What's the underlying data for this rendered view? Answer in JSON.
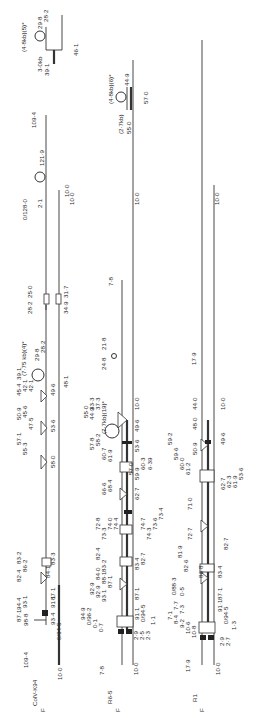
{
  "figure": {
    "type": "plasmid restriction/physical maps (rotated 90°)",
    "maps": [
      {
        "name": "ColV-K94",
        "orientation_label": "F",
        "ends": {
          "left_top": "109·4",
          "left_bottom": "10·0"
        },
        "labels_top": [
          "98·8",
          "94·4",
          "87·1",
          "93·1",
          "86·2",
          "83·2",
          "82·4",
          "57·1",
          "50·9",
          "55·3",
          "47·5",
          "45·6",
          "45·4",
          "42·1",
          "39·1",
          "29·8",
          "28·2",
          "28·2",
          "25·0",
          "0/128·0",
          "2·1",
          "121·9",
          "109·4"
        ],
        "labels_bottom": [
          "0/94·5",
          "93·4",
          "91·1",
          "87·1",
          "84·1",
          "83·3",
          "58·0",
          "53·6",
          "49·6",
          "48·1",
          "34·9",
          "31·7",
          "10·0"
        ],
        "insert_label": "(7·75 kb)(4)*"
      },
      {
        "name": "R6-5",
        "orientation_label": "F",
        "ends": {
          "left_top": "7·8",
          "left_bottom": "10·0"
        },
        "labels_top": [
          "94·9",
          "0/96·2",
          "0·1",
          "0·7",
          "92·9",
          "92·9",
          "93·1",
          "88·1",
          "84·0",
          "87·1",
          "82·4",
          "83·2",
          "72·8",
          "73·3",
          "74·0",
          "74·4",
          "66·6",
          "68·4",
          "58·2",
          "57·8",
          "60·7",
          "61·9",
          "55·0",
          "44·9",
          "33·3",
          "37·3",
          "24·8",
          "21·8",
          "7·8"
        ],
        "labels_bottom": [
          "1·1",
          "2·3",
          "2·5",
          "2·9",
          "91·1",
          "0/94·5",
          "87·1",
          "83·4",
          "82·7",
          "74·7",
          "74·3",
          "73·6",
          "73·4",
          "71·2",
          "62·7",
          "60·3",
          "59·9",
          "6·39",
          "57·0",
          "53·6",
          "49·6",
          "10·0"
        ],
        "insert_label": "(7·7kb)(19)*"
      },
      {
        "name": "R1",
        "orientation_label": "F",
        "ends": {
          "left_top": "17·9",
          "left_bottom": "10·0"
        },
        "labels_top": [
          "10·8",
          "10·6",
          "9·2",
          "8·4",
          "7·1",
          "7·7",
          "7·3",
          "0·5",
          "0/88·3",
          "82·6",
          "81·9",
          "72·7",
          "71·0",
          "61·2",
          "60·0",
          "59·6",
          "59·2",
          "50·9",
          "48·0",
          "44·0",
          "17·9"
        ],
        "labels_bottom": [
          "1·3",
          "2·7",
          "2·9",
          "91·1",
          "0/94·5",
          "86·8",
          "87·1",
          "83·4",
          "82·7",
          "63·9",
          "62·7",
          "62·3",
          "61·9",
          "53·6",
          "49·6",
          "10·0"
        ]
      }
    ],
    "insets": [
      {
        "label": "(4·8kb)(5)*",
        "sub": "3·0kb",
        "values": [
          "29·8",
          "28·2",
          "39·1",
          "46·1"
        ]
      },
      {
        "label": "(4·8kb)(6)*",
        "sub": "(2·7kb)",
        "values": [
          "44·9",
          "55·0",
          "57·0"
        ]
      }
    ]
  }
}
